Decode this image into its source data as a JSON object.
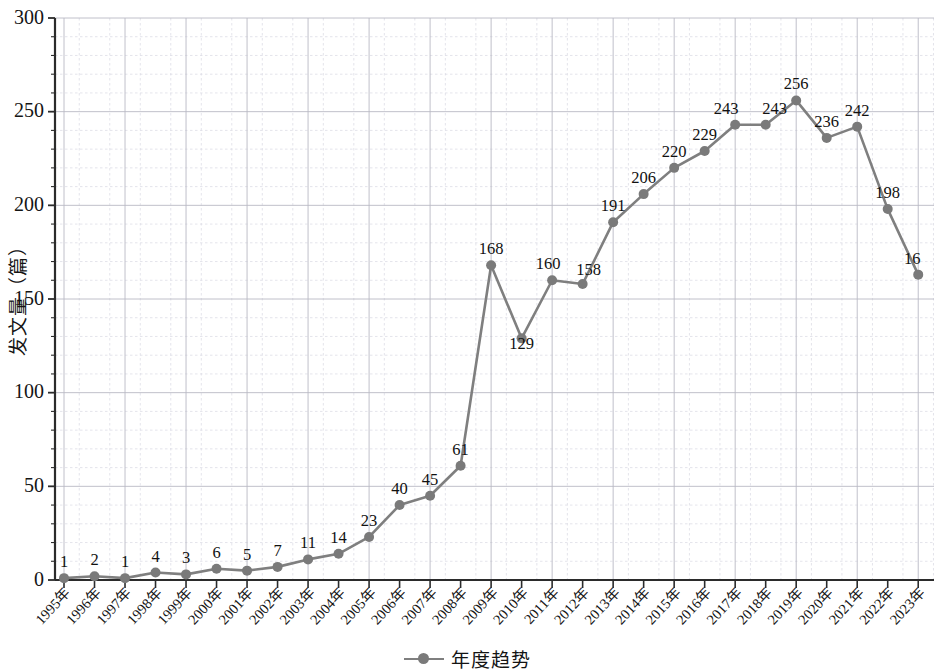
{
  "chart_data": {
    "type": "line",
    "title": "",
    "xlabel": "",
    "ylabel": "发文量（篇）",
    "ylim": [
      0,
      300
    ],
    "yticks": [
      0,
      50,
      100,
      150,
      200,
      250,
      300
    ],
    "grid": true,
    "minor_grid": true,
    "legend_position": "bottom-center",
    "series": [
      {
        "name": "年度趋势",
        "color": "#7f7f7f",
        "marker": "circle",
        "values": [
          1,
          2,
          1,
          4,
          3,
          6,
          5,
          7,
          11,
          14,
          23,
          40,
          45,
          61,
          168,
          129,
          160,
          158,
          191,
          206,
          220,
          229,
          243,
          243,
          256,
          236,
          242,
          198,
          163
        ]
      }
    ],
    "categories": [
      "1995年",
      "1996年",
      "1997年",
      "1998年",
      "1999年",
      "2000年",
      "2001年",
      "2002年",
      "2003年",
      "2004年",
      "2005年",
      "2006年",
      "2007年",
      "2008年",
      "2009年",
      "2010年",
      "2011年",
      "2012年",
      "2013年",
      "2014年",
      "2015年",
      "2016年",
      "2017年",
      "2018年",
      "2019年",
      "2020年",
      "2021年",
      "2022年",
      "2023年"
    ],
    "point_labels": [
      "1",
      "2",
      "1",
      "4",
      "3",
      "6",
      "5",
      "7",
      "11",
      "14",
      "23",
      "40",
      "45",
      "61",
      "168",
      "129",
      "160",
      "158",
      "191",
      "206",
      "220",
      "229",
      "243",
      "243",
      "256",
      "236",
      "242",
      "198",
      "16"
    ]
  },
  "axes": {
    "y_title": "发文量（篇）",
    "y_tick_labels": [
      "0",
      "50",
      "100",
      "150",
      "200",
      "250",
      "300"
    ]
  },
  "legend": {
    "entries": [
      {
        "label": "年度趋势",
        "color": "#7f7f7f"
      }
    ]
  },
  "colors": {
    "series": "#7f7f7f",
    "marker": "#7a7a7a",
    "axis": "#2b2b2b",
    "grid_major": "#b9b9c4",
    "grid_minor": "#d9d9e2",
    "background": "#ffffff"
  }
}
